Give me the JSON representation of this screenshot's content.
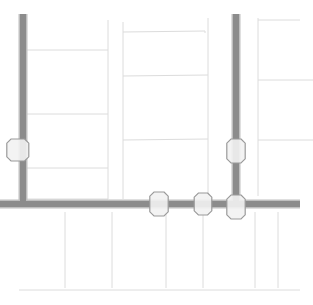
{
  "view": {
    "title": "Map View",
    "width": 313,
    "height": 305,
    "background_color": "#ffffff"
  },
  "legend": {
    "road_color": "#8c8c8c",
    "road_casing_color": "#bfbfbf",
    "parcel_line_color": "#dcdcdc",
    "node_fill_color": "#f2f2f2",
    "node_stroke_color": "#9a9a9a"
  },
  "roads": [
    {
      "name": "west-vertical-road",
      "orientation": "vertical",
      "path": "M 23 14 L 23 204"
    },
    {
      "name": "east-vertical-road",
      "orientation": "vertical",
      "path": "M 236 14 L 236 207"
    },
    {
      "name": "main-horizontal-road",
      "orientation": "horizontal",
      "path": "M 0 204 L 300 204"
    }
  ],
  "nodes": [
    {
      "name": "node-west-edge",
      "cx": 20,
      "cy": 150,
      "r": 11
    },
    {
      "name": "node-east-upper",
      "cx": 236,
      "cy": 151,
      "r": 12
    },
    {
      "name": "node-junction-left",
      "cx": 159,
      "cy": 204,
      "r": 12
    },
    {
      "name": "node-junction-center",
      "cx": 203,
      "cy": 204,
      "r": 11
    },
    {
      "name": "node-junction-east",
      "cx": 236,
      "cy": 207,
      "r": 12
    }
  ],
  "parcels": {
    "west_block": [
      "M 23 50 L 108 50",
      "M 23 114 L 108 114",
      "M 23 168 L 108 168",
      "M 108 20 L 108 199",
      "M 23 199 L 108 199"
    ],
    "center_block": [
      "M 123 22 L 123 199",
      "M 123 32 L 205 31 L 205 33",
      "M 123 76 L 208 75",
      "M 123 140 L 208 139",
      "M 208 18 L 208 199"
    ],
    "east_block": [
      "M 258 18 L 258 196",
      "M 258 20 L 300 20",
      "M 258 80 L 313 80",
      "M 258 140 L 313 140"
    ],
    "south_block": [
      "M 19 290 L 300 290",
      "M 65 212 L 65 288",
      "M 112 212 L 112 288",
      "M 166 212 L 166 288",
      "M 203 212 L 203 288",
      "M 255 212 L 255 288",
      "M 278 212 L 278 288"
    ]
  }
}
